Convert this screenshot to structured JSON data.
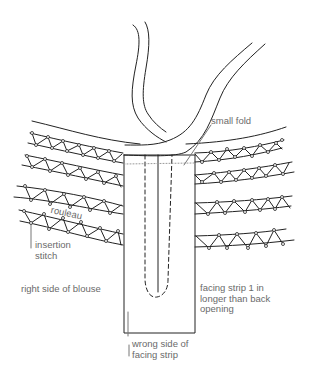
{
  "diagram": {
    "labels": {
      "small_fold": "small fold",
      "rouleau": "rouleau",
      "insertion_stitch": "insertion\nstitch",
      "right_side_of_blouse": "right side of blouse",
      "facing_strip_note": "facing strip 1 in\nlonger than back\nopening",
      "wrong_side_of_facing_strip": "wrong side of\nfacing strip"
    },
    "colors": {
      "line": "#222222",
      "label_text": "#6a6a6a",
      "leader": "#777777",
      "background": "#ffffff"
    }
  }
}
